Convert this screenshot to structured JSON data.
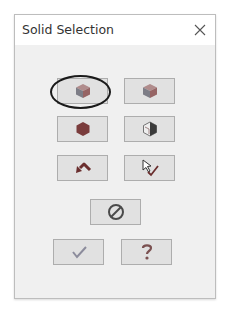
{
  "window": {
    "title": "Solid Selection",
    "close_icon": "close-icon"
  },
  "buttons": [
    {
      "name": "select-solid-button",
      "icon": "cube-shaded-icon",
      "highlighted": true
    },
    {
      "name": "select-solid-alt-button",
      "icon": "cube-shaded-icon",
      "highlighted": false
    },
    {
      "name": "select-solid-dark-button",
      "icon": "hexagon-solid-icon",
      "highlighted": false
    },
    {
      "name": "select-solid-section-button",
      "icon": "cube-sectioned-icon",
      "highlighted": false
    },
    {
      "name": "undo-button",
      "icon": "undo-arrow-icon",
      "highlighted": false
    },
    {
      "name": "pick-check-button",
      "icon": "cursor-check-icon",
      "highlighted": false
    },
    {
      "name": "cancel-selection-button",
      "icon": "prohibited-icon",
      "highlighted": false
    },
    {
      "name": "ok-button",
      "icon": "checkmark-icon",
      "highlighted": false
    },
    {
      "name": "help-button",
      "icon": "question-mark-icon",
      "highlighted": false
    }
  ],
  "colors": {
    "dialog_bg": "#f0f0f0",
    "titlebar_bg": "#ffffff",
    "button_bg": "#e1e1e1",
    "button_border": "#adadad",
    "highlight_ellipse": "#1a1a1a"
  }
}
